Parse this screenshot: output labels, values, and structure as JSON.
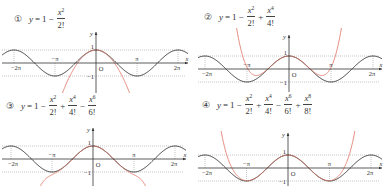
{
  "chart_data": [
    {
      "type": "line",
      "panel_number": "①",
      "title": "y = 1 − x^2/2!",
      "formula_terms": [
        {
          "sign": "",
          "text": "1"
        },
        {
          "sign": "−",
          "num": "x",
          "exp": "2",
          "den": "2!"
        }
      ],
      "coefficients": [
        1,
        0,
        -0.5
      ],
      "series": [
        {
          "name": "y = cos x",
          "color": "#2b2b2b"
        },
        {
          "name": "Taylor polynomial degree 2",
          "color": "#e0705f"
        }
      ],
      "xlabel": "x",
      "ylabel": "y",
      "x_ticks": [
        "−2π",
        "−π",
        "O",
        "π",
        "2π"
      ],
      "y_ticks": [
        "1",
        "−1"
      ],
      "xlim": [
        "−2π",
        "2π"
      ],
      "ylim": [
        -1,
        1
      ],
      "layout": {
        "ox": 96,
        "oy": 63,
        "px_per_pi": 41,
        "px_per_unit": 13,
        "x_left": 2,
        "x_right": 188,
        "y_top": 32,
        "y_bottom": 93,
        "clip_top": 30,
        "clip_bottom": 93
      }
    },
    {
      "type": "line",
      "panel_number": "②",
      "title": "y = 1 − x^2/2! + x^4/4!",
      "formula_terms": [
        {
          "sign": "",
          "text": "1"
        },
        {
          "sign": "−",
          "num": "x",
          "exp": "2",
          "den": "2!"
        },
        {
          "sign": "+",
          "num": "x",
          "exp": "4",
          "den": "4!"
        }
      ],
      "coefficients": [
        1,
        0,
        -0.5,
        0,
        0.041667
      ],
      "series": [
        {
          "name": "y = cos x",
          "color": "#2b2b2b"
        },
        {
          "name": "Taylor polynomial degree 4",
          "color": "#e0705f"
        }
      ],
      "xlabel": "x",
      "ylabel": "y",
      "x_ticks": [
        "−2π",
        "−π",
        "O",
        "π",
        "2π"
      ],
      "y_ticks": [
        "1",
        "−1"
      ],
      "xlim": [
        "−2π",
        "2π"
      ],
      "ylim": [
        -1,
        1
      ],
      "layout": {
        "ox": 289,
        "oy": 69,
        "px_per_pi": 42,
        "px_per_unit": 13,
        "x_left": 198,
        "x_right": 382,
        "y_top": 35,
        "y_bottom": 92,
        "clip_top": 28,
        "clip_bottom": 92
      }
    },
    {
      "type": "line",
      "panel_number": "③",
      "title": "y = 1 − x^2/2! + x^4/4! − x^6/6!",
      "formula_terms": [
        {
          "sign": "",
          "text": "1"
        },
        {
          "sign": "−",
          "num": "x",
          "exp": "2",
          "den": "2!"
        },
        {
          "sign": "+",
          "num": "x",
          "exp": "4",
          "den": "4!"
        },
        {
          "sign": "−",
          "num": "x",
          "exp": "6",
          "den": "6!"
        }
      ],
      "coefficients": [
        1,
        0,
        -0.5,
        0,
        0.041667,
        0,
        -0.0013889
      ],
      "series": [
        {
          "name": "y = cos x",
          "color": "#2b2b2b"
        },
        {
          "name": "Taylor polynomial degree 6",
          "color": "#e0705f"
        }
      ],
      "xlabel": "x",
      "ylabel": "y",
      "x_ticks": [
        "−2π",
        "−π",
        "O",
        "π",
        "2π"
      ],
      "y_ticks": [
        "1",
        "−1"
      ],
      "xlim": [
        "−2π",
        "2π"
      ],
      "ylim": [
        -1,
        1
      ],
      "layout": {
        "ox": 93,
        "oy": 159,
        "px_per_pi": 41,
        "px_per_unit": 13,
        "x_left": 2,
        "x_right": 186,
        "y_top": 128,
        "y_bottom": 186,
        "clip_top": 128,
        "clip_bottom": 186
      }
    },
    {
      "type": "line",
      "panel_number": "④",
      "title": "y = 1 − x^2/2! + x^4/4! − x^6/6! + x^8/8!",
      "formula_terms": [
        {
          "sign": "",
          "text": "1"
        },
        {
          "sign": "−",
          "num": "x",
          "exp": "2",
          "den": "2!"
        },
        {
          "sign": "+",
          "num": "x",
          "exp": "4",
          "den": "4!"
        },
        {
          "sign": "−",
          "num": "x",
          "exp": "6",
          "den": "6!"
        },
        {
          "sign": "+",
          "num": "x",
          "exp": "8",
          "den": "8!"
        }
      ],
      "coefficients": [
        1,
        0,
        -0.5,
        0,
        0.041667,
        0,
        -0.0013889,
        0,
        2.48e-05
      ],
      "series": [
        {
          "name": "y = cos x",
          "color": "#2b2b2b"
        },
        {
          "name": "Taylor polynomial degree 8",
          "color": "#e0705f"
        }
      ],
      "xlabel": "x",
      "ylabel": "y",
      "x_ticks": [
        "−2π",
        "−π",
        "O",
        "π",
        "2π"
      ],
      "y_ticks": [
        "1",
        "−1"
      ],
      "xlim": [
        "−2π",
        "2π"
      ],
      "ylim": [
        -1,
        1
      ],
      "layout": {
        "ox": 288,
        "oy": 168,
        "px_per_pi": 41.5,
        "px_per_unit": 13,
        "x_left": 198,
        "x_right": 382,
        "y_top": 133,
        "y_bottom": 186,
        "clip_top": 131,
        "clip_bottom": 186
      }
    }
  ],
  "formula_positions": [
    {
      "left": 14,
      "top": 8
    },
    {
      "left": 204,
      "top": 6
    },
    {
      "left": 6,
      "top": 95
    },
    {
      "left": 202,
      "top": 94
    }
  ],
  "colors": {
    "axis": "#333333",
    "cos_curve": "#2b2b2b",
    "taylor_curve": "#e0705f",
    "guide": "#888888"
  }
}
